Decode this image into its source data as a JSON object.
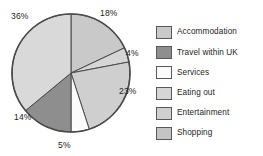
{
  "chart_data": {
    "type": "pie",
    "title": "",
    "categories": [
      "Accommodation",
      "Eating out",
      "Entertainment",
      "Services",
      "Travel within UK",
      "Shopping"
    ],
    "values": [
      18,
      4,
      23,
      5,
      14,
      36
    ],
    "value_labels": [
      "18%",
      "4%",
      "23%",
      "5%",
      "14%",
      "36%"
    ],
    "units": "percent",
    "total": 100,
    "start_angle_deg": 0,
    "direction": "clockwise",
    "grid": false,
    "legend_position": "right",
    "legend_entries": [
      {
        "label": "Accommodation",
        "color": "#c9c9c9"
      },
      {
        "label": "Travel within UK",
        "color": "#8e8e8e"
      },
      {
        "label": "Services",
        "color": "#fbfbfb"
      },
      {
        "label": "Eating out",
        "color": "#d6d6d6"
      },
      {
        "label": "Entertainment",
        "color": "#cfcfcf"
      },
      {
        "label": "Shopping",
        "color": "#c4c4c4"
      }
    ],
    "slice_colors": [
      "#c9c9c9",
      "#d6d6d6",
      "#cfcfcf",
      "#fbfbfb",
      "#8e8e8e",
      "#d9d9d9"
    ],
    "outline_color": "#4a4a4a"
  },
  "labels": {
    "p0": "18%",
    "p1": "4%",
    "p2": "23%",
    "p3": "5%",
    "p4": "14%",
    "p5": "36%"
  },
  "legend": {
    "items": [
      {
        "label": "Accommodation"
      },
      {
        "label": "Travel within UK"
      },
      {
        "label": "Services"
      },
      {
        "label": "Eating out"
      },
      {
        "label": "Entertainment"
      },
      {
        "label": "Shopping"
      }
    ]
  }
}
